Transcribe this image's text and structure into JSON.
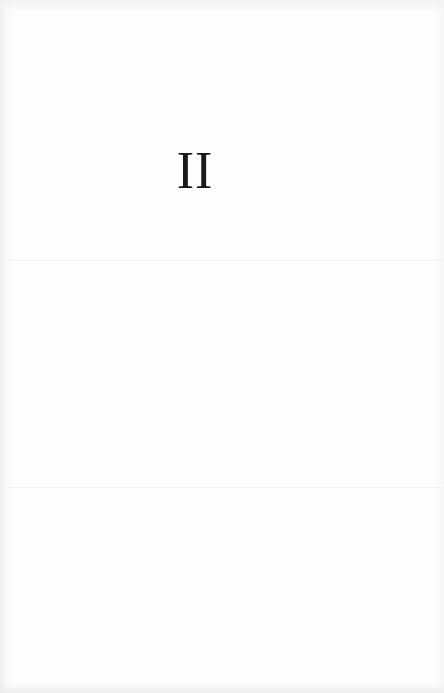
{
  "document": {
    "section_numeral": "II"
  },
  "colors": {
    "paper": "#fdfdfd",
    "ink": "#1a1a1a"
  }
}
